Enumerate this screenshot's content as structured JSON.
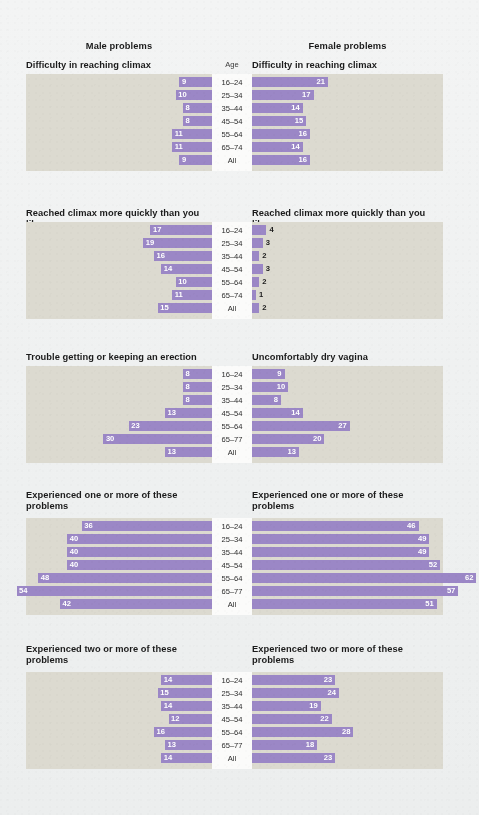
{
  "figure": {
    "background": "#f2f3f3",
    "plot_background": "#dcdad0",
    "male_heading": "Male problems",
    "female_heading": "Female problems",
    "age_header": "Age"
  },
  "palette": {
    "16-24": "#9a5795",
    "25-34": "#6f7243",
    "35-44": "#c2b248",
    "45-54": "#6f9fc3",
    "55-64": "#e8763c",
    "65-74": "#8ca04c",
    "All": "#9b87c6"
  },
  "age_groups_a": [
    "16–24",
    "25–34",
    "35–44",
    "45–54",
    "55–64",
    "65–74",
    "All"
  ],
  "age_groups_b": [
    "16–24",
    "25–34",
    "35–44",
    "45–54",
    "55–64",
    "65–77",
    "All"
  ],
  "chart_data": {
    "type": "bar",
    "xlabel": "Percentage reporting problem (%)",
    "ylabel": "Age",
    "orientation": "horizontal",
    "grid": false,
    "legend": "none",
    "xlim": [
      0,
      62
    ],
    "panels": [
      {
        "index": 1,
        "male_title": "Difficulty in reaching climax",
        "female_title": "Difficulty in reaching climax",
        "categories": [
          "16–24",
          "25–34",
          "35–44",
          "45–54",
          "55–64",
          "65–74",
          "All"
        ],
        "series": [
          {
            "name": "Male",
            "values": [
              9,
              10,
              8,
              8,
              11,
              11,
              9
            ]
          },
          {
            "name": "Female",
            "values": [
              21,
              17,
              14,
              15,
              16,
              14,
              16
            ]
          }
        ]
      },
      {
        "index": 2,
        "male_title": "Reached climax more quickly than you like",
        "female_title": "Reached climax more quickly than you like",
        "categories": [
          "16–24",
          "25–34",
          "35–44",
          "45–54",
          "55–64",
          "65–74",
          "All"
        ],
        "series": [
          {
            "name": "Male",
            "values": [
              17,
              19,
              16,
              14,
              10,
              11,
              15
            ]
          },
          {
            "name": "Female",
            "values": [
              4,
              3,
              2,
              3,
              2,
              1,
              2
            ]
          }
        ]
      },
      {
        "index": 3,
        "male_title": "Trouble getting or keeping an erection",
        "female_title": "Uncomfortably dry vagina",
        "categories": [
          "16–24",
          "25–34",
          "35–44",
          "45–54",
          "55–64",
          "65–77",
          "All"
        ],
        "series": [
          {
            "name": "Male",
            "values": [
              8,
              8,
              8,
              13,
              23,
              30,
              13
            ]
          },
          {
            "name": "Female",
            "values": [
              9,
              10,
              8,
              14,
              27,
              20,
              13
            ]
          }
        ]
      },
      {
        "index": 4,
        "male_title": "Experienced one or more of these problems",
        "female_title": "Experienced one or more of these problems",
        "categories": [
          "16–24",
          "25–34",
          "35–44",
          "45–54",
          "55–64",
          "65–77",
          "All"
        ],
        "series": [
          {
            "name": "Male",
            "values": [
              36,
              40,
              40,
              40,
              48,
              54,
              42
            ]
          },
          {
            "name": "Female",
            "values": [
              46,
              49,
              49,
              52,
              62,
              57,
              51
            ]
          }
        ]
      },
      {
        "index": 5,
        "male_title": "Experienced two or more of these problems",
        "female_title": "Experienced two or more of these problems",
        "categories": [
          "16–24",
          "25–34",
          "35–44",
          "45–54",
          "55–64",
          "65–77",
          "All"
        ],
        "series": [
          {
            "name": "Male",
            "values": [
              14,
              15,
              14,
              12,
              16,
              13,
              14
            ]
          },
          {
            "name": "Female",
            "values": [
              23,
              24,
              19,
              22,
              28,
              18,
              23
            ]
          }
        ]
      }
    ]
  }
}
